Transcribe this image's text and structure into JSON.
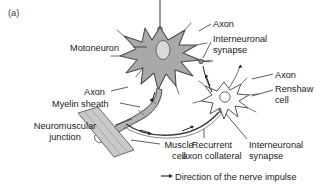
{
  "figure": {
    "panel_label": "(a)",
    "domain_type": "anatomical-diagram"
  },
  "labels": {
    "motoneuron": "Motoneuron",
    "axon_top": "Axon",
    "interneuronal_synapse_top_line1": "Interneuronal",
    "interneuronal_synapse_top_line2": "synapse",
    "axon_right": "Axon",
    "renshaw_line1": "Renshaw",
    "renshaw_line2": "cell",
    "axon_left": "Axon",
    "myelin_sheath": "Myelin sheath",
    "neuromuscular_junction_line1": "Neuromuscular",
    "neuromuscular_junction_line2": "junction",
    "muscle_cell_line1": "Muscle",
    "muscle_cell_line2": "cell",
    "recurrent_collateral_line1": "Recurrent",
    "recurrent_collateral_line2": "axon collateral",
    "interneuronal_synapse_bottom_line1": "Interneuronal",
    "interneuronal_synapse_bottom_line2": "synapse"
  },
  "legend": {
    "arrow_glyph": "arrow-right-icon",
    "text": "Direction of the nerve impulse"
  },
  "colors": {
    "background": "#ffffff",
    "text": "#1a1a1a",
    "soma_fill": "#a9a9a9",
    "soma_stroke": "#4a4a4a",
    "nucleus_fill": "#d8d8d8",
    "renshaw_fill": "#fdfdfd",
    "renshaw_stroke": "#555555",
    "axon_fill": "#b3b3b3",
    "axon_stroke": "#4a4a4a",
    "muscle_fill": "#c9c9c9",
    "muscle_stroke": "#6a6a6a",
    "leader_line": "#333333"
  }
}
